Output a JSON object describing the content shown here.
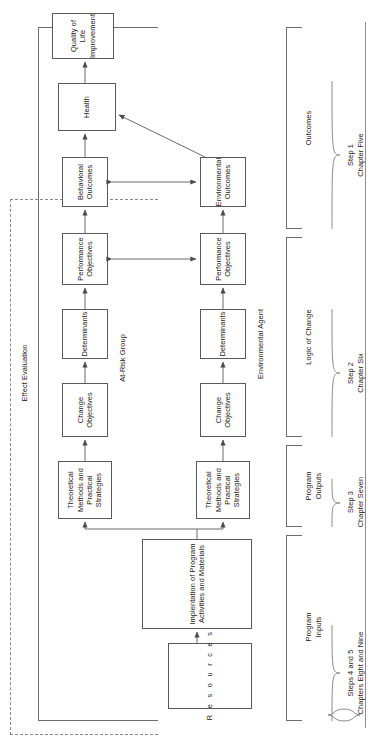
{
  "figure": {
    "orientation": "rotated-90-ccw",
    "evaluation_labels": {
      "effect": "Effect Evaluation",
      "process": "Process Evaluation"
    },
    "row_labels": {
      "at_risk": "At-Risk Group",
      "environmental_agent": "Environmental Agent"
    },
    "boxes": {
      "resources": "Resources",
      "resources_letters": [
        "R",
        "e",
        "s",
        "o",
        "u",
        "r",
        "c",
        "e",
        "s"
      ],
      "implementation": "Implentation\nof Program\nActivities\nand Materials",
      "methods_top": "Theoretical\nMethods and\nPractical\nStrategies",
      "methods_bottom": "Theoretical\nMethods and\nPractical\nStrategies",
      "change_obj_top": "Change\nObjectives",
      "change_obj_bottom": "Change\nObjectives",
      "determinants_top": "Determinants",
      "determinants_bottom": "Determinants",
      "perf_obj_top": "Performance\nObjectives",
      "perf_obj_bottom": "Performance\nObjectives",
      "behavioral_outcomes": "Behavioral\nOutcomes",
      "environmental_outcomes": "Environmental\nOutcomes",
      "health": "Health",
      "quality_of_life": "Quality\nof Life\nImprovement"
    },
    "bands": [
      {
        "key": "program_inputs",
        "label": "Program\nInputs"
      },
      {
        "key": "program_outputs",
        "label": "Program\nOutputs"
      },
      {
        "key": "logic_of_change",
        "label": "Logic of Change"
      },
      {
        "key": "outcomes",
        "label": "Outcomes"
      }
    ],
    "steps": [
      {
        "key": "steps_4_5",
        "step": "Steps 4 and 5",
        "chapter": "Chapters Eight and Nine"
      },
      {
        "key": "step_3",
        "step": "Step 3",
        "chapter": "Chapter Seven"
      },
      {
        "key": "step_2",
        "step": "Step 2",
        "chapter": "Chapter Six"
      },
      {
        "key": "step_1",
        "step": "Step 1",
        "chapter": "Chapter Five"
      }
    ]
  }
}
